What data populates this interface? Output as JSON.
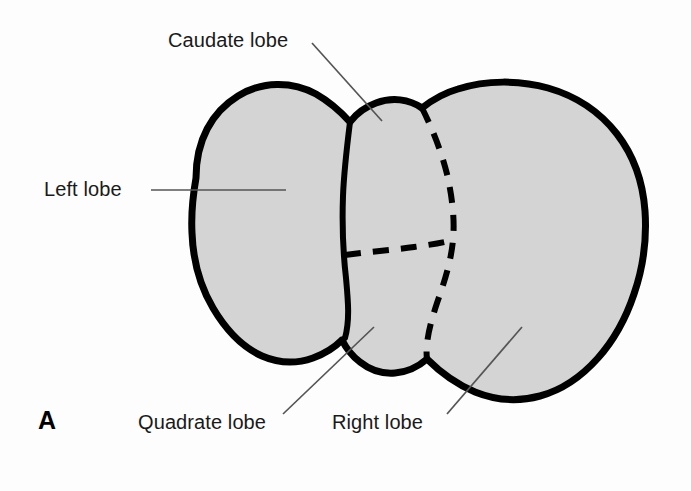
{
  "figure": {
    "panel_letter": "A",
    "background_color": "#fdfdfd",
    "organ_fill_color": "#d4d4d4",
    "outline_color": "#000000",
    "leader_line_color": "#555555",
    "label_text_color": "#1a1a1a"
  },
  "labels": [
    {
      "id": "caudate",
      "text": "Caudate lobe"
    },
    {
      "id": "left",
      "text": "Left lobe"
    },
    {
      "id": "quadrate",
      "text": "Quadrate lobe"
    },
    {
      "id": "right",
      "text": "Right lobe"
    }
  ]
}
